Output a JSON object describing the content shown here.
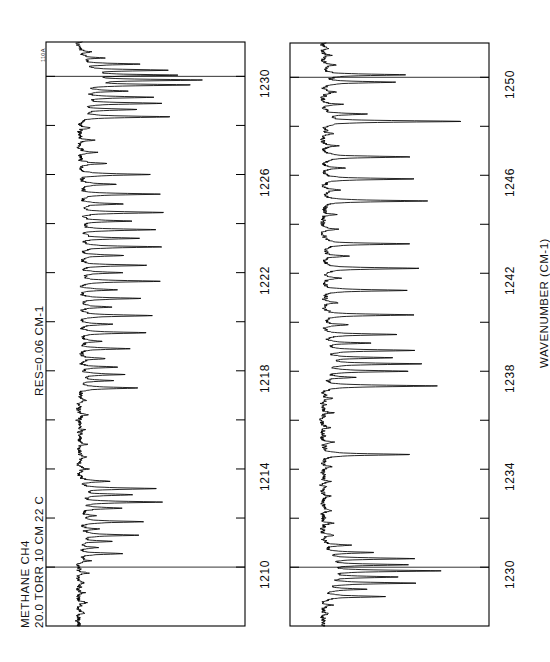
{
  "figure": {
    "orientation": "rotated-90-ccw",
    "background_color": "#ffffff",
    "trace_color": "#000000",
    "frame_color": "#000000",
    "corner_code": "110A"
  },
  "annotations": {
    "sample_line1": "METHANE  CH4",
    "sample_line2": "20.0 TORR  10 CM  22 C",
    "resolution": "RES=0.06 CM-1",
    "axis_title": "WAVENUMBER  (CM-1)"
  },
  "chart_data": {
    "type": "line",
    "title": "METHANE  CH4",
    "subtitle": "20.0 TORR  10 CM  22 C    RES=0.06 CM-1",
    "xlabel": "WAVENUMBER  (CM-1)",
    "ylabel": "TRANSMITTANCE",
    "grid": false,
    "legend": false,
    "panels": [
      {
        "name": "upper-panel",
        "xlim": [
          1207.6,
          1231.4
        ],
        "ylim": [
          0.0,
          1.0
        ],
        "major_ticks": [
          1210,
          1214,
          1218,
          1222,
          1226,
          1230
        ],
        "minor_ticks": [
          1212,
          1216,
          1220,
          1224,
          1228
        ],
        "tick_labels": [
          "1210",
          "1214",
          "1218",
          "1222",
          "1226",
          "1230"
        ],
        "internal_rules": [
          1210,
          1230
        ],
        "baseline": 0.97,
        "peaks": [
          {
            "x": 1208.15,
            "depth": 0.05
          },
          {
            "x": 1208.55,
            "depth": 0.06
          },
          {
            "x": 1208.95,
            "depth": 0.04
          },
          {
            "x": 1209.35,
            "depth": 0.05
          },
          {
            "x": 1209.75,
            "depth": 0.06
          },
          {
            "x": 1210.25,
            "depth": 0.08
          },
          {
            "x": 1210.55,
            "depth": 0.3
          },
          {
            "x": 1210.8,
            "depth": 0.12
          },
          {
            "x": 1211.05,
            "depth": 0.22
          },
          {
            "x": 1211.3,
            "depth": 0.4
          },
          {
            "x": 1211.55,
            "depth": 0.14
          },
          {
            "x": 1211.85,
            "depth": 0.43
          },
          {
            "x": 1212.1,
            "depth": 0.1
          },
          {
            "x": 1212.4,
            "depth": 0.3
          },
          {
            "x": 1212.65,
            "depth": 0.55
          },
          {
            "x": 1212.95,
            "depth": 0.36
          },
          {
            "x": 1213.2,
            "depth": 0.52
          },
          {
            "x": 1213.5,
            "depth": 0.2
          },
          {
            "x": 1214.0,
            "depth": 0.07
          },
          {
            "x": 1214.5,
            "depth": 0.05
          },
          {
            "x": 1215.0,
            "depth": 0.06
          },
          {
            "x": 1215.6,
            "depth": 0.05
          },
          {
            "x": 1216.2,
            "depth": 0.06
          },
          {
            "x": 1216.8,
            "depth": 0.05
          },
          {
            "x": 1217.3,
            "depth": 0.4
          },
          {
            "x": 1217.6,
            "depth": 0.22
          },
          {
            "x": 1217.85,
            "depth": 0.3
          },
          {
            "x": 1218.15,
            "depth": 0.26
          },
          {
            "x": 1218.5,
            "depth": 0.18
          },
          {
            "x": 1218.9,
            "depth": 0.33
          },
          {
            "x": 1219.2,
            "depth": 0.16
          },
          {
            "x": 1219.55,
            "depth": 0.45
          },
          {
            "x": 1219.9,
            "depth": 0.22
          },
          {
            "x": 1220.25,
            "depth": 0.5
          },
          {
            "x": 1220.6,
            "depth": 0.2
          },
          {
            "x": 1220.95,
            "depth": 0.42
          },
          {
            "x": 1221.3,
            "depth": 0.26
          },
          {
            "x": 1221.65,
            "depth": 0.55
          },
          {
            "x": 1222.0,
            "depth": 0.28
          },
          {
            "x": 1222.3,
            "depth": 0.46
          },
          {
            "x": 1222.7,
            "depth": 0.3
          },
          {
            "x": 1223.05,
            "depth": 0.56
          },
          {
            "x": 1223.4,
            "depth": 0.4
          },
          {
            "x": 1223.75,
            "depth": 0.52
          },
          {
            "x": 1224.1,
            "depth": 0.35
          },
          {
            "x": 1224.45,
            "depth": 0.58
          },
          {
            "x": 1224.8,
            "depth": 0.3
          },
          {
            "x": 1225.2,
            "depth": 0.54
          },
          {
            "x": 1225.6,
            "depth": 0.25
          },
          {
            "x": 1226.0,
            "depth": 0.48
          },
          {
            "x": 1226.45,
            "depth": 0.2
          },
          {
            "x": 1226.9,
            "depth": 0.12
          },
          {
            "x": 1227.4,
            "depth": 0.1
          },
          {
            "x": 1227.9,
            "depth": 0.08
          },
          {
            "x": 1228.35,
            "depth": 0.62
          },
          {
            "x": 1228.65,
            "depth": 0.38
          },
          {
            "x": 1228.9,
            "depth": 0.55
          },
          {
            "x": 1229.15,
            "depth": 0.48
          },
          {
            "x": 1229.4,
            "depth": 0.3
          },
          {
            "x": 1229.65,
            "depth": 0.72
          },
          {
            "x": 1229.85,
            "depth": 0.8
          },
          {
            "x": 1230.05,
            "depth": 0.62
          },
          {
            "x": 1230.25,
            "depth": 0.58
          },
          {
            "x": 1230.5,
            "depth": 0.4
          },
          {
            "x": 1230.75,
            "depth": 0.16
          },
          {
            "x": 1231.0,
            "depth": 0.08
          }
        ]
      },
      {
        "name": "lower-panel",
        "xlim": [
          1227.6,
          1251.4
        ],
        "ylim": [
          0.0,
          1.0
        ],
        "major_ticks": [
          1230,
          1234,
          1238,
          1242,
          1246,
          1250
        ],
        "minor_ticks": [
          1232,
          1236,
          1240,
          1244,
          1248
        ],
        "tick_labels": [
          "1230",
          "1234",
          "1238",
          "1242",
          "1246",
          "1250"
        ],
        "internal_rules": [
          1230,
          1250
        ],
        "baseline": 0.97,
        "peaks": [
          {
            "x": 1228.1,
            "depth": 0.05
          },
          {
            "x": 1228.45,
            "depth": 0.06
          },
          {
            "x": 1228.8,
            "depth": 0.42
          },
          {
            "x": 1229.1,
            "depth": 0.28
          },
          {
            "x": 1229.35,
            "depth": 0.62
          },
          {
            "x": 1229.6,
            "depth": 0.5
          },
          {
            "x": 1229.85,
            "depth": 0.78
          },
          {
            "x": 1230.1,
            "depth": 0.55
          },
          {
            "x": 1230.35,
            "depth": 0.6
          },
          {
            "x": 1230.6,
            "depth": 0.34
          },
          {
            "x": 1230.9,
            "depth": 0.18
          },
          {
            "x": 1231.3,
            "depth": 0.08
          },
          {
            "x": 1231.8,
            "depth": 0.06
          },
          {
            "x": 1232.3,
            "depth": 0.05
          },
          {
            "x": 1232.9,
            "depth": 0.06
          },
          {
            "x": 1233.5,
            "depth": 0.05
          },
          {
            "x": 1234.1,
            "depth": 0.06
          },
          {
            "x": 1234.6,
            "depth": 0.6
          },
          {
            "x": 1235.1,
            "depth": 0.08
          },
          {
            "x": 1235.7,
            "depth": 0.06
          },
          {
            "x": 1236.3,
            "depth": 0.07
          },
          {
            "x": 1236.9,
            "depth": 0.06
          },
          {
            "x": 1237.4,
            "depth": 0.78
          },
          {
            "x": 1237.75,
            "depth": 0.2
          },
          {
            "x": 1238.0,
            "depth": 0.58
          },
          {
            "x": 1238.3,
            "depth": 0.66
          },
          {
            "x": 1238.55,
            "depth": 0.44
          },
          {
            "x": 1238.85,
            "depth": 0.62
          },
          {
            "x": 1239.15,
            "depth": 0.3
          },
          {
            "x": 1239.5,
            "depth": 0.5
          },
          {
            "x": 1239.9,
            "depth": 0.16
          },
          {
            "x": 1240.3,
            "depth": 0.62
          },
          {
            "x": 1240.8,
            "depth": 0.1
          },
          {
            "x": 1241.3,
            "depth": 0.58
          },
          {
            "x": 1241.8,
            "depth": 0.12
          },
          {
            "x": 1242.2,
            "depth": 0.66
          },
          {
            "x": 1242.7,
            "depth": 0.18
          },
          {
            "x": 1243.2,
            "depth": 0.6
          },
          {
            "x": 1243.8,
            "depth": 0.1
          },
          {
            "x": 1244.4,
            "depth": 0.08
          },
          {
            "x": 1244.95,
            "depth": 0.72
          },
          {
            "x": 1245.4,
            "depth": 0.12
          },
          {
            "x": 1245.85,
            "depth": 0.62
          },
          {
            "x": 1246.3,
            "depth": 0.14
          },
          {
            "x": 1246.75,
            "depth": 0.6
          },
          {
            "x": 1247.2,
            "depth": 0.1
          },
          {
            "x": 1247.7,
            "depth": 0.08
          },
          {
            "x": 1248.2,
            "depth": 0.95
          },
          {
            "x": 1248.5,
            "depth": 0.3
          },
          {
            "x": 1248.9,
            "depth": 0.12
          },
          {
            "x": 1249.4,
            "depth": 0.08
          },
          {
            "x": 1249.8,
            "depth": 0.48
          },
          {
            "x": 1250.1,
            "depth": 0.56
          },
          {
            "x": 1250.5,
            "depth": 0.1
          },
          {
            "x": 1250.9,
            "depth": 0.06
          },
          {
            "x": 1251.2,
            "depth": 0.05
          }
        ]
      }
    ]
  }
}
